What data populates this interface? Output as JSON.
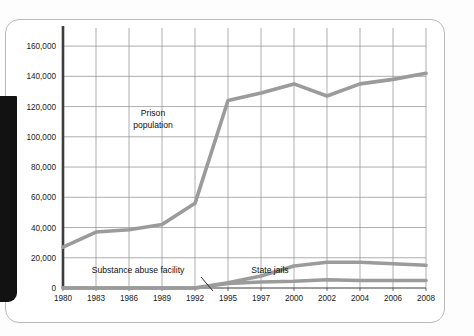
{
  "figure": {
    "name": "prison-population-line-chart",
    "background_color": "#ffffff",
    "card_border_color": "#b9b9b9",
    "spine_color": "#121212"
  },
  "axis": {
    "line_color": "#4a4a4a",
    "grid_color": "#8d8d8d",
    "y_ticks": [
      "0",
      "20,000",
      "40,000",
      "60,000",
      "80,000",
      "100,000",
      "120,000",
      "140,000",
      "160,000"
    ],
    "x_ticks": [
      "1980",
      "1983",
      "1986",
      "1989",
      "1992",
      "1995",
      "1997",
      "2000",
      "2002",
      "2004",
      "2006",
      "2008"
    ]
  },
  "annotations": {
    "prison_line1": "Prison",
    "prison_line2": "population",
    "substance": "Substance abuse facility",
    "state_jails": "State jails"
  },
  "chart_data": {
    "type": "line",
    "title": "",
    "xlabel": "",
    "ylabel": "",
    "ylim": [
      0,
      168000
    ],
    "grid": true,
    "legend": "inline-annotations",
    "line_color": "#9b9b9b",
    "x": [
      "1980",
      "1983",
      "1986",
      "1989",
      "1992",
      "1995",
      "1997",
      "2000",
      "2002",
      "2004",
      "2006",
      "2008"
    ],
    "categories": [
      "1980",
      "1983",
      "1986",
      "1989",
      "1992",
      "1995",
      "1997",
      "2000",
      "2002",
      "2004",
      "2006",
      "2008"
    ],
    "series": [
      {
        "name": "Prison population",
        "values": [
          27000,
          37000,
          38500,
          42000,
          56000,
          124000,
          129000,
          135000,
          127000,
          135000,
          138000,
          142000
        ]
      },
      {
        "name": "State jails",
        "values": [
          0,
          0,
          0,
          0,
          0,
          3500,
          8000,
          14500,
          17000,
          17000,
          16000,
          15000
        ]
      },
      {
        "name": "Substance abuse facility",
        "values": [
          0,
          0,
          0,
          0,
          0,
          3000,
          4000,
          4500,
          5500,
          5000,
          5000,
          5000
        ]
      }
    ]
  }
}
